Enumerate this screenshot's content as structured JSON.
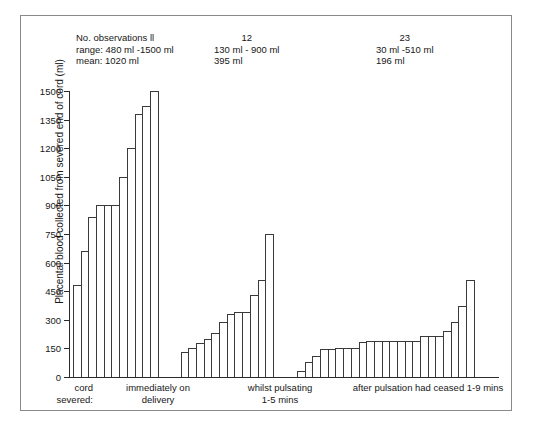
{
  "chart_data": {
    "type": "bar",
    "title": "",
    "xlabel": "cord severed:",
    "ylabel": "Placental blood collected from severed end of cord (ml)",
    "ylim": [
      0,
      1500
    ],
    "yticks": [
      0,
      150,
      300,
      450,
      600,
      750,
      900,
      1050,
      1200,
      1350,
      1500
    ],
    "grid": false,
    "legend": "none",
    "groups": [
      {
        "name": "immediately on delivery",
        "label_lines": [
          "immediately on",
          "delivery"
        ],
        "n_observations": "11",
        "range": "480 ml -1500 ml",
        "mean": "1020 ml",
        "annotation_lines": [
          "No. observations ll",
          "range: 480 ml -1500 ml",
          "mean: 1020 ml"
        ],
        "values": [
          480,
          660,
          840,
          900,
          900,
          900,
          1050,
          1200,
          1380,
          1420,
          1500
        ]
      },
      {
        "name": "whilst pulsating 1-5 mins",
        "label_lines": [
          "whilst pulsating",
          "1-5 mins"
        ],
        "n_observations": "12",
        "range": "130 ml - 900 ml",
        "mean": "395 ml",
        "annotation_lines": [
          "12",
          "130 ml - 900 ml",
          "395 ml"
        ],
        "values": [
          130,
          150,
          180,
          200,
          230,
          290,
          330,
          340,
          340,
          430,
          510,
          750
        ]
      },
      {
        "name": "after pulsation had ceased 1-9 mins",
        "label_lines": [
          "after pulsation had ceased 1-9 mins"
        ],
        "n_observations": "23",
        "range": "30 ml -510 ml",
        "mean": "196 ml",
        "annotation_lines": [
          "23",
          "30 ml -510 ml",
          "196 ml"
        ],
        "values": [
          30,
          80,
          110,
          145,
          145,
          150,
          150,
          150,
          185,
          190,
          190,
          190,
          190,
          190,
          190,
          190,
          215,
          215,
          215,
          240,
          290,
          370,
          510
        ]
      }
    ]
  },
  "axis": {
    "y_title": "Placental blood collected from severed end of cord (ml)",
    "tick_labels": [
      "1500",
      "1350",
      "1200",
      "1050",
      "900",
      "750",
      "600",
      "450",
      "300",
      "150",
      "0"
    ],
    "x_prefix_lines": [
      "cord",
      "severed:"
    ]
  },
  "annotations": {
    "group1": {
      "line1": "No. observations ll",
      "line2": "range: 480 ml -1500 ml",
      "line3": "mean: 1020 ml"
    },
    "group2": {
      "line1": "12",
      "line2": "130 ml - 900 ml",
      "line3": "395 ml"
    },
    "group3": {
      "line1": "23",
      "line2": "30 ml -510 ml",
      "line3": "196 ml"
    }
  },
  "xlabels": {
    "group1_line1": "immediately on",
    "group1_line2": "delivery",
    "group2_line1": "whilst pulsating",
    "group2_line2": "1-5 mins",
    "group3_line1": "after pulsation had ceased 1-9 mins"
  },
  "colors": {
    "bar_stroke": "#3a3a3a",
    "bar_fill": "#ffffff",
    "axis": "#2b2b2b",
    "frame": "#8a8a8a",
    "text": "#171717"
  }
}
